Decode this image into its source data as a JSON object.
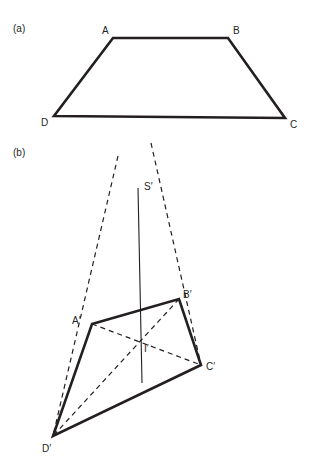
{
  "figure": {
    "width": 318,
    "height": 475,
    "background_color": "#ffffff",
    "stroke_color": "#231f20",
    "text_color": "#231f20",
    "solid_thick_width": 2.6,
    "solid_thin_width": 1.0,
    "dashed_width": 1.2,
    "dash_pattern": "5,4"
  },
  "panels": [
    {
      "key": "a",
      "label": "(a)",
      "label_x": 13,
      "label_y": 24
    },
    {
      "key": "b",
      "label": "(b)",
      "label_x": 13,
      "label_y": 148
    }
  ],
  "panel_a": {
    "shape_name": "trapezoid-ABCD",
    "vertices": [
      {
        "name": "A",
        "label": "A",
        "x": 113,
        "y": 38,
        "label_x": 102,
        "label_y": 26
      },
      {
        "name": "B",
        "label": "B",
        "x": 228,
        "y": 38,
        "label_x": 233,
        "label_y": 26
      },
      {
        "name": "C",
        "label": "C",
        "x": 285,
        "y": 118,
        "label_x": 290,
        "label_y": 120
      },
      {
        "name": "D",
        "label": "D",
        "x": 54,
        "y": 116,
        "label_x": 41,
        "label_y": 118
      }
    ],
    "outline_points": "113,38 228,38 285,118 54,116"
  },
  "panel_b": {
    "shape_name": "quadrilateral-A-B-C-D-prime",
    "vertices": [
      {
        "name": "A-prime",
        "label": "A′",
        "x": 92,
        "y": 324,
        "label_x": 72,
        "label_y": 316
      },
      {
        "name": "B-prime",
        "label": "B′",
        "x": 179,
        "y": 299,
        "label_x": 183,
        "label_y": 290
      },
      {
        "name": "C-prime",
        "label": "C′",
        "x": 201,
        "y": 365,
        "label_x": 206,
        "label_y": 362
      },
      {
        "name": "D-prime",
        "label": "D′",
        "x": 53,
        "y": 436,
        "label_x": 42,
        "label_y": 444
      }
    ],
    "outline_points": "92,324 179,299 201,365 53,436",
    "vanishing_point": {
      "name": "S-prime",
      "label": "S′",
      "x": 138,
      "y": 188,
      "label_x": 144,
      "label_y": 182
    },
    "intersection_point": {
      "name": "I-prime",
      "label": "I′",
      "x": 138,
      "y": 342,
      "label_x": 144,
      "label_y": 344
    },
    "axis_line": {
      "name": "vertical-axis",
      "x1": 138,
      "y1": 188,
      "x2": 142,
      "y2": 383
    },
    "projection_rays": [
      {
        "name": "ray-S-through-A-to-D",
        "x1": 118,
        "y1": 156,
        "x2": 53,
        "y2": 436
      },
      {
        "name": "ray-S-through-B-to-C",
        "x1": 151,
        "y1": 143,
        "x2": 201,
        "y2": 365
      }
    ],
    "diagonals": [
      {
        "name": "diagonal-A-prime-C-prime",
        "x1": 92,
        "y1": 324,
        "x2": 201,
        "y2": 365
      },
      {
        "name": "diagonal-B-prime-D-prime",
        "x1": 179,
        "y1": 299,
        "x2": 53,
        "y2": 436
      }
    ]
  }
}
